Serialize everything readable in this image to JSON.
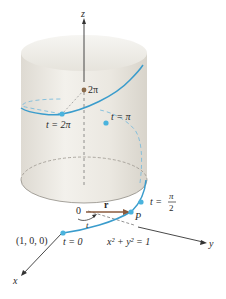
{
  "figure": {
    "axes": {
      "x_label": "x",
      "y_label": "y",
      "z_label": "z"
    },
    "labels": {
      "origin": "0",
      "point_100": "(1, 0, 0)",
      "t0": "t = 0",
      "t_pi_2_prefix": "t =",
      "t_pi_2_num": "π",
      "t_pi_2_den": "2",
      "t_pi": "t = π",
      "t_2pi": "t = 2π",
      "z_2pi": "2π",
      "vector_r": "r",
      "point_P": "P",
      "angle_t": "t",
      "cylinder_eq": "x² + y² = 1"
    },
    "colors": {
      "helix": "#3a9ccc",
      "point": "#4ab3dd",
      "vector_r": "#8a5a3c",
      "axis": "#333333",
      "cylinder_fill": "#e9e6df",
      "cylinder_edge": "#cfcac0",
      "z_marker": "#8a6a4a"
    }
  }
}
